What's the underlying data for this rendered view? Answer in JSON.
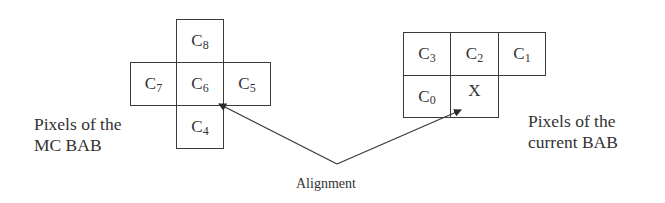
{
  "diagram": {
    "mc_bab": {
      "label_line1": "Pixels of the",
      "label_line2": "MC BAB",
      "cells": [
        {
          "id": "C8",
          "base": "C",
          "sub": "8"
        },
        {
          "id": "C7",
          "base": "C",
          "sub": "7"
        },
        {
          "id": "C6",
          "base": "C",
          "sub": "6"
        },
        {
          "id": "C5",
          "base": "C",
          "sub": "5"
        },
        {
          "id": "C4",
          "base": "C",
          "sub": "4"
        }
      ]
    },
    "current_bab": {
      "label_line1": "Pixels of the",
      "label_line2": "current BAB",
      "cells": [
        {
          "id": "C3",
          "base": "C",
          "sub": "3"
        },
        {
          "id": "C2",
          "base": "C",
          "sub": "2"
        },
        {
          "id": "C1",
          "base": "C",
          "sub": "1"
        },
        {
          "id": "C0",
          "base": "C",
          "sub": "0"
        },
        {
          "id": "X",
          "base": "X",
          "sub": ""
        }
      ]
    },
    "alignment_label": "Alignment",
    "colors": {
      "line": "#3a3a3a",
      "text": "#333333",
      "background": "#ffffff"
    }
  }
}
